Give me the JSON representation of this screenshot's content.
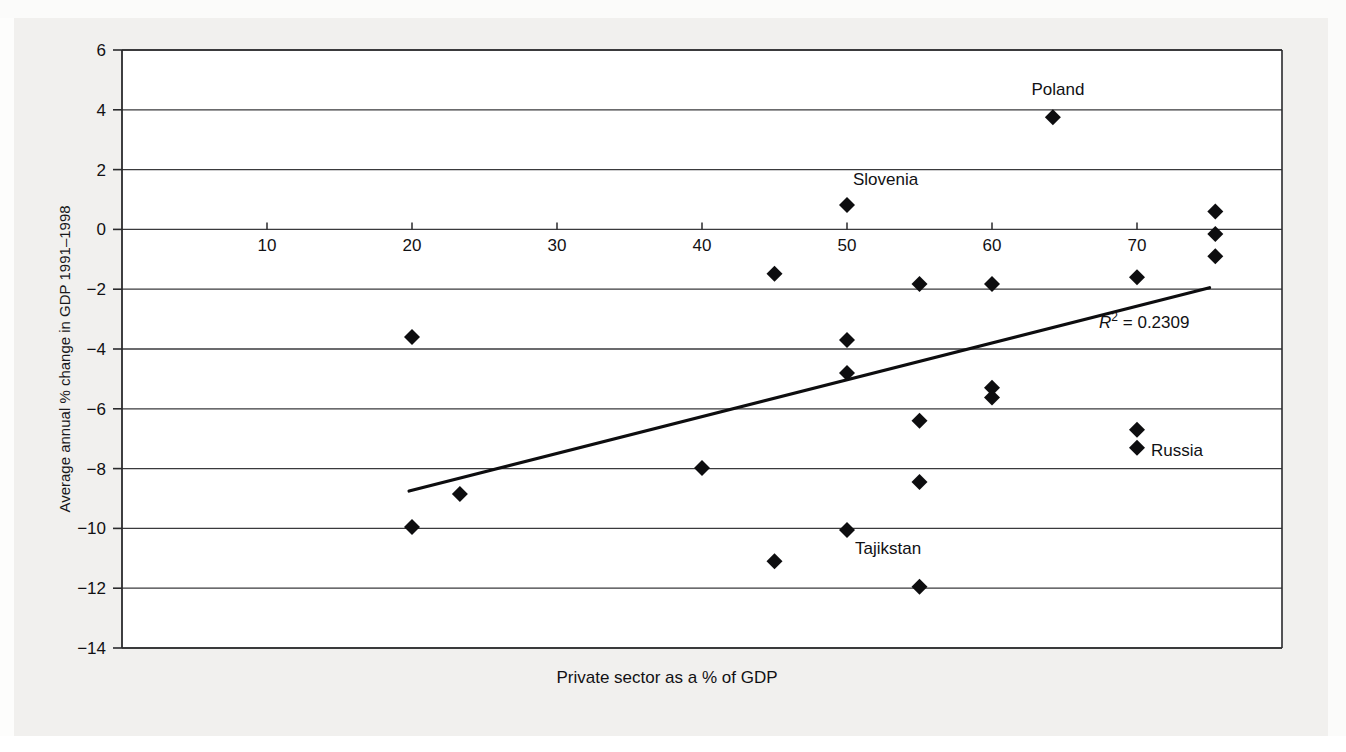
{
  "chart_data": {
    "type": "scatter",
    "title": "",
    "xlabel": "Private sector as a % of GDP",
    "ylabel": "Average annual % change in GDP 1991–1998",
    "xlim": [
      0,
      80
    ],
    "ylim": [
      -14,
      6
    ],
    "xticks": [
      10,
      20,
      30,
      40,
      50,
      60,
      70
    ],
    "yticks": [
      6,
      4,
      2,
      0,
      -2,
      -4,
      -6,
      -8,
      -10,
      -12,
      -14
    ],
    "grid": "horizontal",
    "legend": "none",
    "annotations": [
      {
        "text": "R² = 0.2309",
        "x": 70.5,
        "y": -3.3
      }
    ],
    "trendline": {
      "label": "linear fit",
      "x0": 19.8,
      "y0": -8.75,
      "x1": 75.0,
      "y1": -1.95
    },
    "points": [
      {
        "x": 20.0,
        "y": -9.95,
        "label": ""
      },
      {
        "x": 20.0,
        "y": -3.6,
        "label": ""
      },
      {
        "x": 23.3,
        "y": -8.85,
        "label": ""
      },
      {
        "x": 40.0,
        "y": -7.98,
        "label": ""
      },
      {
        "x": 45.0,
        "y": -1.48,
        "label": ""
      },
      {
        "x": 45.0,
        "y": -11.1,
        "label": ""
      },
      {
        "x": 50.0,
        "y": 0.82,
        "label": "Slovenia"
      },
      {
        "x": 50.0,
        "y": -3.7,
        "label": ""
      },
      {
        "x": 50.0,
        "y": -4.8,
        "label": ""
      },
      {
        "x": 50.0,
        "y": -10.05,
        "label": "Tajikstan"
      },
      {
        "x": 55.0,
        "y": -1.83,
        "label": ""
      },
      {
        "x": 55.0,
        "y": -6.4,
        "label": ""
      },
      {
        "x": 55.0,
        "y": -8.45,
        "label": ""
      },
      {
        "x": 55.0,
        "y": -11.95,
        "label": ""
      },
      {
        "x": 60.0,
        "y": -1.83,
        "label": ""
      },
      {
        "x": 60.0,
        "y": -5.3,
        "label": ""
      },
      {
        "x": 60.0,
        "y": -5.62,
        "label": ""
      },
      {
        "x": 64.2,
        "y": 3.75,
        "label": "Poland"
      },
      {
        "x": 70.0,
        "y": -1.6,
        "label": ""
      },
      {
        "x": 70.0,
        "y": -6.7,
        "label": ""
      },
      {
        "x": 70.0,
        "y": -7.3,
        "label": "Russia"
      },
      {
        "x": 75.4,
        "y": 0.6,
        "label": ""
      },
      {
        "x": 75.4,
        "y": -0.15,
        "label": ""
      },
      {
        "x": 75.4,
        "y": -0.9,
        "label": ""
      }
    ],
    "point_labels": [
      {
        "text": "Poland",
        "x": 64.2,
        "y": 3.75,
        "dx": 5,
        "dy": -22,
        "anchor": "middle"
      },
      {
        "text": "Slovenia",
        "x": 50.0,
        "y": 0.82,
        "dx": 6,
        "dy": -20,
        "anchor": "start"
      },
      {
        "text": "Tajikstan",
        "x": 50.0,
        "y": -10.05,
        "dx": 8,
        "dy": 24,
        "anchor": "start"
      },
      {
        "text": "Russia",
        "x": 70.0,
        "y": -7.3,
        "dx": 14,
        "dy": 8,
        "anchor": "start"
      }
    ],
    "marker": {
      "shape": "diamond",
      "color": "#0d0d0f",
      "size": 16
    },
    "colors": {
      "background": "#f1f0ee",
      "plot_background": "#ffffff",
      "axis": "#2a2a2c",
      "gridline": "#3a3a3c",
      "trendline": "#0d0d0f",
      "text": "#111114"
    }
  }
}
